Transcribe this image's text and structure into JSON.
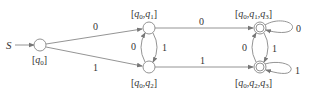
{
  "diagram": {
    "type": "state-transition (DFA)",
    "start_label": "S",
    "states": [
      {
        "id": "q0",
        "name": "q0",
        "sub": "0",
        "label_parts": [
          "q",
          "0"
        ],
        "accepting": false,
        "cx": 40,
        "cy": 45
      },
      {
        "id": "q0q1",
        "label_parts": [
          "q0",
          "q1"
        ],
        "accepting": false,
        "cx": 149,
        "cy": 28
      },
      {
        "id": "q0q2",
        "label_parts": [
          "q0",
          "q2"
        ],
        "accepting": false,
        "cx": 149,
        "cy": 67
      },
      {
        "id": "q0q1q3",
        "label_parts": [
          "q0",
          "q1",
          "q3"
        ],
        "accepting": true,
        "cx": 260,
        "cy": 28
      },
      {
        "id": "q0q2q3",
        "label_parts": [
          "q0",
          "q2",
          "q3"
        ],
        "accepting": true,
        "cx": 260,
        "cy": 67
      }
    ],
    "transitions": [
      {
        "from": "q0",
        "to": "q0q1",
        "symbol": "0"
      },
      {
        "from": "q0",
        "to": "q0q2",
        "symbol": "1"
      },
      {
        "from": "q0q2",
        "to": "q0q1",
        "symbol": "0"
      },
      {
        "from": "q0q1",
        "to": "q0q2",
        "symbol": "1"
      },
      {
        "from": "q0q1",
        "to": "q0q1q3",
        "symbol": "0"
      },
      {
        "from": "q0q2",
        "to": "q0q2q3",
        "symbol": "1"
      },
      {
        "from": "q0q2q3",
        "to": "q0q1q3",
        "symbol": "0"
      },
      {
        "from": "q0q1q3",
        "to": "q0q2q3",
        "symbol": "1"
      },
      {
        "from": "q0q1q3",
        "to": "q0q1q3",
        "symbol": "0"
      },
      {
        "from": "q0q2q3",
        "to": "q0q2q3",
        "symbol": "1"
      }
    ],
    "edge_labels": {
      "q0_q0q1": "0",
      "q0_q0q2": "1",
      "q0q2_q0q1": "0",
      "q0q1_q0q2": "1",
      "q0q1_q0q1q3": "0",
      "q0q2_q0q2q3": "1",
      "q0q2q3_q0q1q3": "0",
      "q0q1q3_q0q2q3": "1",
      "loop_q0q1q3": "0",
      "loop_q0q2q3": "1"
    },
    "colors": {
      "stroke": "#888888",
      "text": "#333333",
      "background": "#ffffff"
    }
  }
}
